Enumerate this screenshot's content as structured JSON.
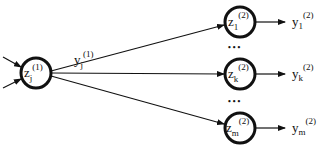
{
  "diagram": {
    "type": "neural-network-fanout",
    "colors": {
      "stroke": "#111111",
      "background": "#ffffff"
    },
    "input_node": {
      "var": "z",
      "sub": "j",
      "sup": "(1)",
      "output_label": {
        "var": "y",
        "sub": "j",
        "sup": "(1)"
      },
      "incoming_arrows": 2
    },
    "output_nodes": [
      {
        "var": "z",
        "sub": "1",
        "sup": "(2)",
        "output_label": {
          "var": "y",
          "sub": "1",
          "sup": "(2)"
        }
      },
      {
        "var": "z",
        "sub": "k",
        "sup": "(2)",
        "output_label": {
          "var": "y",
          "sub": "k",
          "sup": "(2)"
        }
      },
      {
        "var": "z",
        "sub": "m",
        "sup": "(2)",
        "output_label": {
          "var": "y",
          "sub": "m",
          "sup": "(2)"
        }
      }
    ],
    "ellipsis": "• • •"
  }
}
